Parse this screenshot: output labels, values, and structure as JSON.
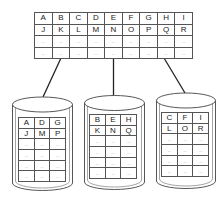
{
  "diagram": {
    "type": "sharding",
    "source_table": {
      "rows": [
        [
          "A",
          "B",
          "C",
          "D",
          "E",
          "F",
          "G",
          "H",
          "I"
        ],
        [
          "J",
          "K",
          "L",
          "M",
          "N",
          "O",
          "P",
          "Q",
          "R"
        ],
        [
          "..",
          "..",
          "..",
          "..",
          "..",
          "..",
          "..",
          "..",
          ".."
        ],
        [
          "..",
          "..",
          "..",
          "..",
          "..",
          "..",
          "..",
          "..",
          ".."
        ]
      ]
    },
    "shards": [
      {
        "rows": [
          [
            "A",
            "D",
            "G"
          ],
          [
            "J",
            "M",
            "P"
          ],
          [
            "..",
            "..",
            ".."
          ],
          [
            "..",
            "..",
            ".."
          ],
          [
            "..",
            "..",
            ".."
          ],
          [
            "..",
            "..",
            ".."
          ]
        ]
      },
      {
        "rows": [
          [
            "B",
            "E",
            "H"
          ],
          [
            "K",
            "N",
            "Q"
          ],
          [
            "..",
            "..",
            ".."
          ],
          [
            "..",
            "..",
            ".."
          ],
          [
            "..",
            "..",
            ".."
          ],
          [
            "..",
            "..",
            ".."
          ]
        ]
      },
      {
        "rows": [
          [
            "C",
            "F",
            "I"
          ],
          [
            "L",
            "O",
            "R"
          ],
          [
            "..",
            "..",
            ".."
          ],
          [
            "..",
            "..",
            ".."
          ],
          [
            "..",
            "..",
            ".."
          ],
          [
            "..",
            "..",
            ".."
          ]
        ]
      }
    ],
    "colors": {
      "stroke": "#222222",
      "grid": "#555555",
      "background": "#ffffff"
    }
  }
}
